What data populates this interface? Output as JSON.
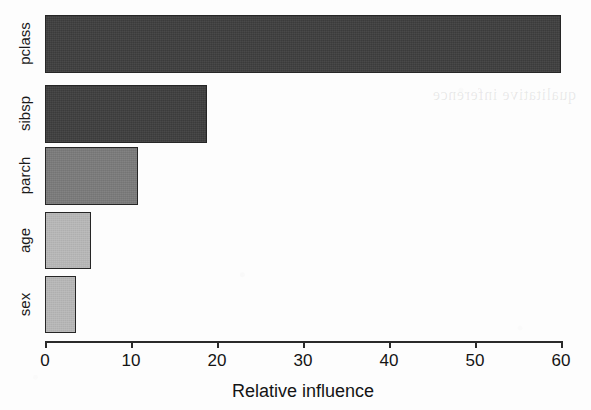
{
  "figure": {
    "width": 591,
    "height": 410,
    "background": "#fdfdfd",
    "bleed_through_text": "qualitative inference"
  },
  "chart_data": {
    "type": "bar",
    "orientation": "horizontal",
    "title": "",
    "subtitle": "",
    "xlabel": "Relative influence",
    "ylabel": "",
    "categories": [
      "sex",
      "age",
      "parch",
      "sibsp",
      "pclass"
    ],
    "values": [
      3.6,
      5.3,
      10.8,
      18.8,
      60.0
    ],
    "bar_colors": [
      "#b8b8b8",
      "#b8b8b8",
      "#7a7a7a",
      "#3e3e3e",
      "#3e3e3e"
    ],
    "xlim": [
      0,
      60
    ],
    "xticks": [
      0,
      10,
      20,
      30,
      40,
      50,
      60
    ],
    "xtick_labels": [
      "0",
      "10",
      "20",
      "30",
      "40",
      "50",
      "60"
    ],
    "grid": false,
    "legend": false,
    "border_color": "#262626",
    "axis_color": "#2a2a2a"
  },
  "geometry": {
    "plot_left_px": 45,
    "plot_right_px": 561,
    "axis_y_px": 341,
    "bars": [
      {
        "key": "pclass",
        "top": 15,
        "height": 58
      },
      {
        "key": "sibsp",
        "top": 85,
        "height": 58
      },
      {
        "key": "parch",
        "top": 147,
        "height": 58
      },
      {
        "key": "age",
        "top": 212,
        "height": 57
      },
      {
        "key": "sex",
        "top": 276,
        "height": 57
      }
    ],
    "tick_length_px": 7,
    "tick_label_y_px": 352,
    "axis_title_y_px": 382,
    "category_label_x_px": 24
  }
}
